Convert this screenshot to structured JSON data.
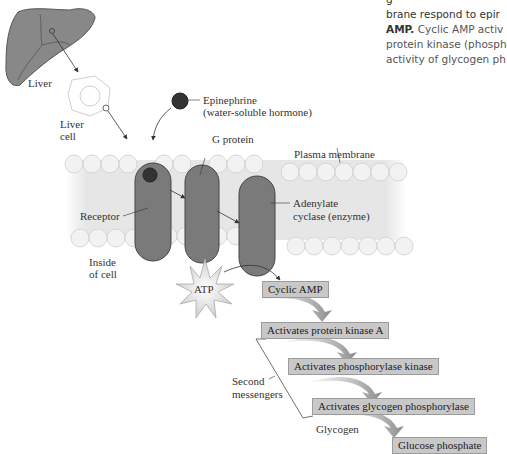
{
  "caption": {
    "lines": [
      "brane respond to epir",
      "AMP.",
      " Cyclic AMP activ",
      "protein kinase (phosph",
      "activity of glycogen ph"
    ]
  },
  "labels": {
    "liver": "Liver",
    "liver_cell_1": "Liver",
    "liver_cell_2": "cell",
    "epinephrine_1": "Epinephrine",
    "epinephrine_2": "(water-soluble hormone)",
    "g_protein": "G protein",
    "plasma_membrane": "Plasma membrane",
    "receptor": "Receptor",
    "adenylate_1": "Adenylate",
    "adenylate_2": "cyclase (enzyme)",
    "inside_1": "Inside",
    "inside_2": "of cell",
    "atp": "ATP",
    "second_1": "Second",
    "second_2": "messengers",
    "glycogen": "Glycogen"
  },
  "cascade": [
    "Cyclic AMP",
    "Activates protein kinase A",
    "Activates phosphorylase kinase",
    "Activates glycogen phosphorylase",
    "Glucose phosphate"
  ],
  "colors": {
    "protein": "#7a7a7a",
    "membrane": "#e4e4e4",
    "step_box": "#c8c8c8",
    "hormone": "#333333"
  }
}
